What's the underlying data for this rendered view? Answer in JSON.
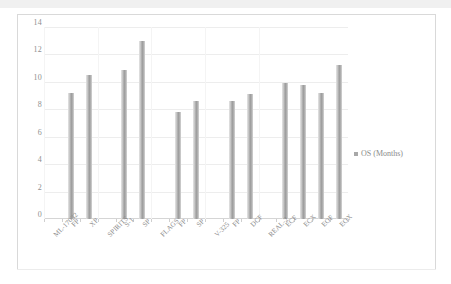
{
  "chart_data": {
    "type": "bar",
    "title": "",
    "xlabel": "",
    "ylabel": "",
    "ylim": [
      0,
      14
    ],
    "ytick_step": 2,
    "ytick_labels": [
      "0",
      "2",
      "4",
      "6",
      "8",
      "10",
      "12",
      "14"
    ],
    "grid": true,
    "legend_position": "right",
    "series": [
      {
        "name": "OS (Months)",
        "color": "#a8a8a8",
        "values": [
          null,
          9.2,
          10.5,
          null,
          10.9,
          13.0,
          null,
          7.8,
          8.6,
          null,
          8.6,
          9.1,
          null,
          9.9,
          9.8,
          9.2,
          11.2
        ]
      }
    ],
    "categories": [
      "ML-17032",
      "FP",
      "XP",
      "SPIRITS",
      "S-1",
      "SP",
      "FLAGS",
      "FP",
      "SP",
      "V-325",
      "FP",
      "DCF",
      "REAL-2",
      "ECF",
      "ECX",
      "EOF",
      "EOX"
    ]
  },
  "legend": {
    "marker": "square-marker",
    "label": "OS (Months)"
  }
}
